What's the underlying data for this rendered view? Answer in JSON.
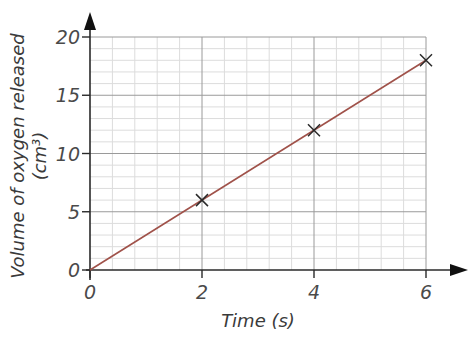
{
  "chart_data": {
    "type": "line",
    "title": "",
    "xlabel": "Time (s)",
    "ylabel": "Volume of oxygen released",
    "ylabel_unit": "(cm³)",
    "xlim": [
      0,
      6
    ],
    "ylim": [
      0,
      20
    ],
    "x_ticks": [
      0,
      2,
      4,
      6
    ],
    "y_ticks": [
      0,
      5,
      10,
      15,
      20
    ],
    "x_tick_labels": [
      "0",
      "2",
      "4",
      "6"
    ],
    "y_tick_labels": [
      "0",
      "5",
      "10",
      "15",
      "20"
    ],
    "grid": true,
    "grid_minor_divisions": 5,
    "legend": null,
    "series": [
      {
        "name": "Oxygen released",
        "x": [
          0,
          2,
          4,
          6
        ],
        "y": [
          0,
          6,
          12,
          18
        ],
        "line_from": [
          0,
          0
        ],
        "line_to": [
          6,
          18
        ],
        "markers_at": [
          [
            2,
            6
          ],
          [
            4,
            12
          ],
          [
            6,
            18
          ]
        ],
        "marker": "x",
        "color": "#a0524a"
      }
    ],
    "colors": {
      "axis": "#2a2a2a",
      "major_grid": "#9a9a9a",
      "minor_grid": "#dcdcdc",
      "line": "#a0524a",
      "marker": "#2a2a2a"
    }
  }
}
